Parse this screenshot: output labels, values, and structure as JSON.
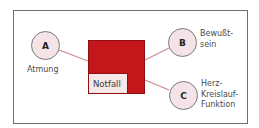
{
  "diagram": {
    "center": {
      "label": "Notfall",
      "color": "#c3171c"
    },
    "nodes": [
      {
        "id": "A",
        "letter": "A",
        "label": "Atmung"
      },
      {
        "id": "B",
        "letter": "B",
        "label": "Bewußt-\nsein"
      },
      {
        "id": "C",
        "letter": "C",
        "label": "Herz-\nKreislauf-\nFunktion"
      }
    ],
    "colors": {
      "connector": "#c98a8e",
      "circle_fill": "#f5e4e7",
      "circle_border": "#7a7a7a",
      "frame_border": "#6e6e6e"
    }
  }
}
